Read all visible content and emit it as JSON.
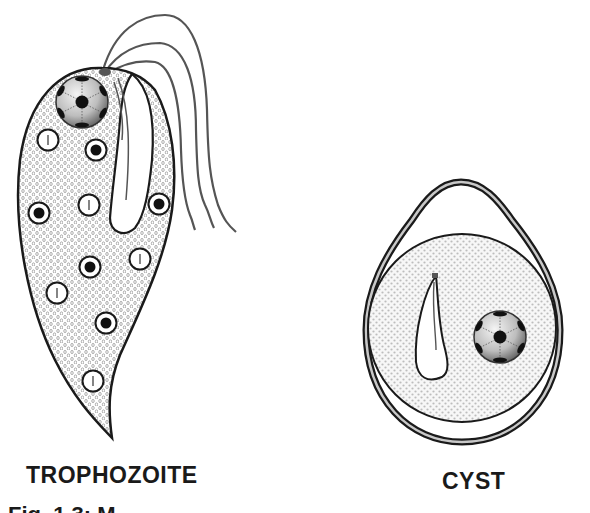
{
  "labels": {
    "trophozoite": "TROPHOZOITE",
    "cyst": "CYST"
  },
  "caption": "Fig. 1.3: M",
  "colors": {
    "outline": "#1a1a1a",
    "flagella": "#555555",
    "cytoplasm_dots": "#8a8a8a",
    "nucleus_light": "#f2f2f2",
    "nucleus_dark": "#555555",
    "cyst_wall_inner": "#c8c8c8"
  },
  "trophozoite": {
    "nucleus": {
      "cx": 82,
      "cy": 102,
      "r": 26
    },
    "clear_vacuoles": [
      {
        "cx": 48,
        "cy": 140
      },
      {
        "cx": 89,
        "cy": 205
      },
      {
        "cx": 140,
        "cy": 259
      },
      {
        "cx": 57,
        "cy": 293
      },
      {
        "cx": 93,
        "cy": 381
      }
    ],
    "dark_vacuoles": [
      {
        "cx": 96,
        "cy": 150
      },
      {
        "cx": 39,
        "cy": 213
      },
      {
        "cx": 159,
        "cy": 204
      },
      {
        "cx": 90,
        "cy": 267
      },
      {
        "cx": 106,
        "cy": 323
      }
    ],
    "flagella_count": 4
  },
  "cyst": {
    "nucleus": {
      "cx": 500,
      "cy": 337,
      "r": 28
    }
  }
}
